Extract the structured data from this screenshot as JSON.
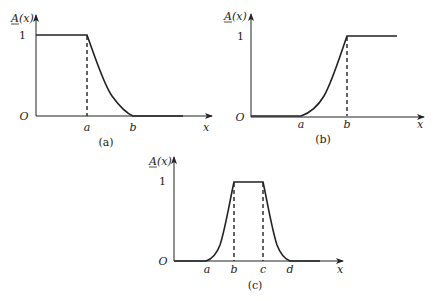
{
  "figure": {
    "panels": [
      {
        "id": "a",
        "caption": "(a)",
        "ylabel_main": "A",
        "ylabel_rest": "(x)",
        "y_tick": "1",
        "origin": "O",
        "xlabel": "x",
        "x_ticks": [
          "a",
          "b"
        ],
        "shape": "decreasing (Z-shaped) membership function"
      },
      {
        "id": "b",
        "caption": "(b)",
        "ylabel_main": "A",
        "ylabel_rest": "(x)",
        "y_tick": "1",
        "origin": "O",
        "xlabel": "x",
        "x_ticks": [
          "a",
          "b"
        ],
        "shape": "increasing (S-shaped) membership function"
      },
      {
        "id": "c",
        "caption": "(c)",
        "ylabel_main": "A",
        "ylabel_rest": "(x)",
        "y_tick": "1",
        "origin": "O",
        "xlabel": "x",
        "x_ticks": [
          "a",
          "b",
          "c",
          "d"
        ],
        "shape": "trapezoidal (bell-sided) membership function"
      }
    ],
    "colors": {
      "stroke": "#222222",
      "background": "#ffffff"
    }
  }
}
